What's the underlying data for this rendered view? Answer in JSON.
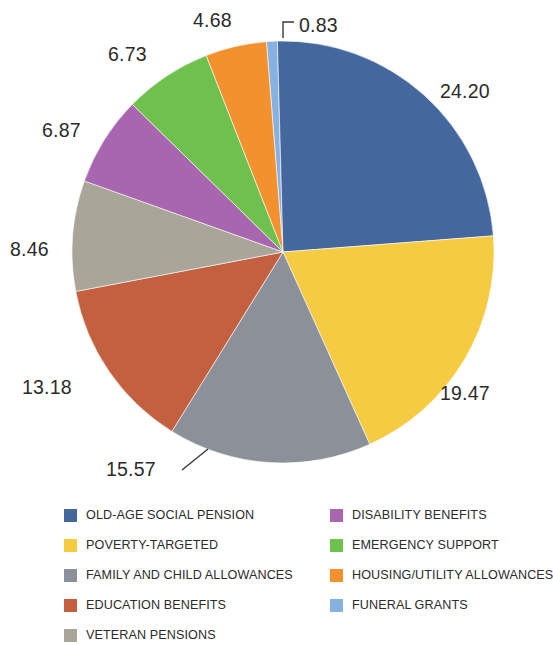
{
  "chart_data": {
    "type": "pie",
    "title": "",
    "subtitle": "",
    "xlabel": "",
    "ylabel": "",
    "legend_position": "bottom",
    "grid": false,
    "value_format": "two-decimal percent share",
    "start_angle_deg": -4.5,
    "direction": "clockwise",
    "categories": [
      "FUNERAL GRANTS",
      "OLD-AGE SOCIAL PENSION",
      "POVERTY-TARGETED",
      "FAMILY AND CHILD ALLOWANCES",
      "EDUCATION BENEFITS",
      "VETERAN PENSIONS",
      "DISABILITY BENEFITS",
      "EMERGENCY SUPPORT",
      "HOUSING/UTILITY ALLOWANCES"
    ],
    "values": [
      0.83,
      24.2,
      19.47,
      15.57,
      13.18,
      8.46,
      6.87,
      6.73,
      4.68
    ],
    "colors": [
      "#86B1E0",
      "#44689D",
      "#F5CB42",
      "#8B9099",
      "#C2603F",
      "#A9A598",
      "#A866AE",
      "#6DC14C",
      "#F2912E"
    ],
    "labels": [
      "0.83",
      "24.20",
      "19.47",
      "15.57",
      "13.18",
      "8.46",
      "6.87",
      "6.73",
      "4.68"
    ],
    "slices": [
      {
        "name": "FUNERAL GRANTS",
        "value": 0.83,
        "label": "0.83",
        "color": "#86B1E0",
        "label_x": 299,
        "label_y": 32,
        "anchor": "start",
        "leader": "M 283,38 L 283,22 L 294,22"
      },
      {
        "name": "OLD-AGE SOCIAL PENSION",
        "value": 24.2,
        "label": "24.20",
        "color": "#44689D",
        "label_x": 440,
        "label_y": 98,
        "anchor": "start",
        "leader": ""
      },
      {
        "name": "POVERTY-TARGETED",
        "value": 19.47,
        "label": "19.47",
        "color": "#F5CB42",
        "label_x": 440,
        "label_y": 400,
        "anchor": "start",
        "leader": ""
      },
      {
        "name": "FAMILY AND CHILD ALLOWANCES",
        "value": 15.57,
        "label": "15.57",
        "color": "#8B9099",
        "label_x": 106,
        "label_y": 476,
        "anchor": "start",
        "leader": "M 182,470 L 208,449"
      },
      {
        "name": "EDUCATION BENEFITS",
        "value": 13.18,
        "label": "13.18",
        "color": "#C2603F",
        "label_x": 22,
        "label_y": 394,
        "anchor": "start",
        "leader": ""
      },
      {
        "name": "VETERAN PENSIONS",
        "value": 8.46,
        "label": "8.46",
        "color": "#A9A598",
        "label_x": 10,
        "label_y": 256,
        "anchor": "start",
        "leader": ""
      },
      {
        "name": "DISABILITY BENEFITS",
        "value": 6.87,
        "label": "6.87",
        "color": "#A866AE",
        "label_x": 42,
        "label_y": 137,
        "anchor": "start",
        "leader": ""
      },
      {
        "name": "EMERGENCY SUPPORT",
        "value": 6.73,
        "label": "6.73",
        "color": "#6DC14C",
        "label_x": 108,
        "label_y": 61,
        "anchor": "start",
        "leader": ""
      },
      {
        "name": "HOUSING/UTILITY ALLOWANCES",
        "value": 4.68,
        "label": "4.68",
        "color": "#F2912E",
        "label_x": 193,
        "label_y": 27,
        "anchor": "start",
        "leader": ""
      }
    ],
    "geometry": {
      "cx": 283,
      "cy": 252,
      "r": 211
    }
  },
  "legend": {
    "columns": [
      {
        "items": [
          {
            "label": "OLD-AGE SOCIAL PENSION",
            "color": "#44689D"
          },
          {
            "label": "POVERTY-TARGETED",
            "color": "#F5CB42"
          },
          {
            "label": "FAMILY AND CHILD ALLOWANCES",
            "color": "#8B9099"
          },
          {
            "label": "EDUCATION BENEFITS",
            "color": "#C2603F"
          },
          {
            "label": "VETERAN PENSIONS",
            "color": "#A9A598"
          }
        ]
      },
      {
        "items": [
          {
            "label": "DISABILITY BENEFITS",
            "color": "#A866AE"
          },
          {
            "label": "EMERGENCY SUPPORT",
            "color": "#6DC14C"
          },
          {
            "label": "HOUSING/UTILITY ALLOWANCES",
            "color": "#F2912E"
          },
          {
            "label": "FUNERAL GRANTS",
            "color": "#86B1E0"
          }
        ]
      }
    ]
  }
}
